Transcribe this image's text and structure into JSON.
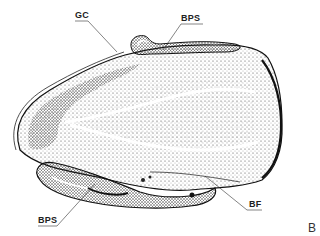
{
  "figure": {
    "panel_letter": "B",
    "labels": [
      {
        "id": "gc",
        "text": "GC"
      },
      {
        "id": "bps_top",
        "text": "BPS"
      },
      {
        "id": "bps_bottom",
        "text": "BPS"
      },
      {
        "id": "bf",
        "text": "BF"
      }
    ],
    "colors": {
      "ink": "#1a1a1a",
      "background": "#ffffff",
      "stipple": "#555555"
    }
  }
}
